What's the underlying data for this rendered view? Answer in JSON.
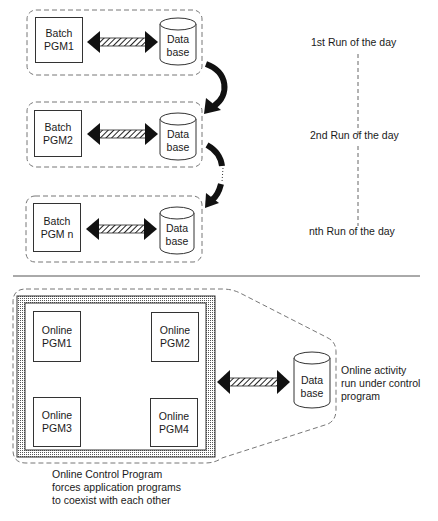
{
  "diagram": {
    "batch_section": {
      "runs": [
        {
          "program_label_line1": "Batch",
          "program_label_line2": "PGM1",
          "database_line1": "Data",
          "database_line2": "base",
          "run_label": "1st Run of the day"
        },
        {
          "program_label_line1": "Batch",
          "program_label_line2": "PGM2",
          "database_line1": "Data",
          "database_line2": "base",
          "run_label": "2nd Run of the day"
        },
        {
          "program_label_line1": "Batch",
          "program_label_line2": "PGM n",
          "database_line1": "Data",
          "database_line2": "base",
          "run_label": "nth Run of the day"
        }
      ]
    },
    "online_section": {
      "programs": [
        {
          "line1": "Online",
          "line2": "PGM1"
        },
        {
          "line1": "Online",
          "line2": "PGM2"
        },
        {
          "line1": "Online",
          "line2": "PGM3"
        },
        {
          "line1": "Online",
          "line2": "PGM4"
        }
      ],
      "database_line1": "Data",
      "database_line2": "base",
      "activity_note": [
        "Online activity",
        "run under control",
        "program"
      ],
      "control_program_note": [
        "Online Control Program",
        "forces application programs",
        "to coexist with each other"
      ]
    },
    "colors": {
      "ink": "#1a1a1a",
      "dash": "#777777",
      "frame_hatch": "#9a9a9a",
      "background": "#ffffff"
    }
  }
}
